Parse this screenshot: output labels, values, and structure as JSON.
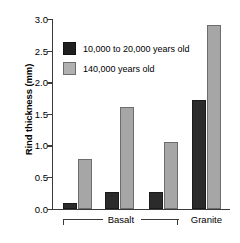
{
  "chart_data": {
    "type": "bar",
    "title": "",
    "xlabel": "",
    "ylabel": "Rind thickness (mm)",
    "ylim": [
      0.0,
      3.0
    ],
    "yticks": [
      "0.0",
      "0.5",
      "1.0",
      "1.5",
      "2.0",
      "2.5",
      "3.0"
    ],
    "ytick_values": [
      0.0,
      0.5,
      1.0,
      1.5,
      2.0,
      2.5,
      3.0
    ],
    "grid": false,
    "legend_position": "upper-left-inside",
    "categories": [
      "Basalt 1",
      "Basalt 2",
      "Basalt 3",
      "Granite"
    ],
    "group_labels": [
      "Basalt",
      "Granite"
    ],
    "series": [
      {
        "name": "10,000 to 20,000 years old",
        "color": "#2b2b2b",
        "values": [
          0.09,
          0.27,
          0.27,
          1.72
        ]
      },
      {
        "name": "140,000 years old",
        "color": "#a6a6a6",
        "values": [
          0.79,
          1.61,
          1.06,
          2.91
        ]
      }
    ]
  },
  "axis": {
    "y_title": "Rind thickness (mm)",
    "ticks": [
      {
        "label": "3.0",
        "value": 3.0
      },
      {
        "label": "2.5",
        "value": 2.5
      },
      {
        "label": "2.0",
        "value": 2.0
      },
      {
        "label": "1.5",
        "value": 1.5
      },
      {
        "label": "1.0",
        "value": 1.0
      },
      {
        "label": "0.5",
        "value": 0.5
      },
      {
        "label": "0.0",
        "value": 0.0
      }
    ]
  },
  "legend": {
    "items": [
      {
        "label": "10,000 to 20,000 years old",
        "swatch": "dark"
      },
      {
        "label": "140,000 years old",
        "swatch": "light"
      }
    ]
  },
  "category_axis": {
    "basalt_label": "Basalt",
    "granite_label": "Granite"
  },
  "colors": {
    "dark_bar": "#2b2b2b",
    "light_bar": "#a6a6a6",
    "axis": "#3a3a3a",
    "background": "#ffffff"
  }
}
